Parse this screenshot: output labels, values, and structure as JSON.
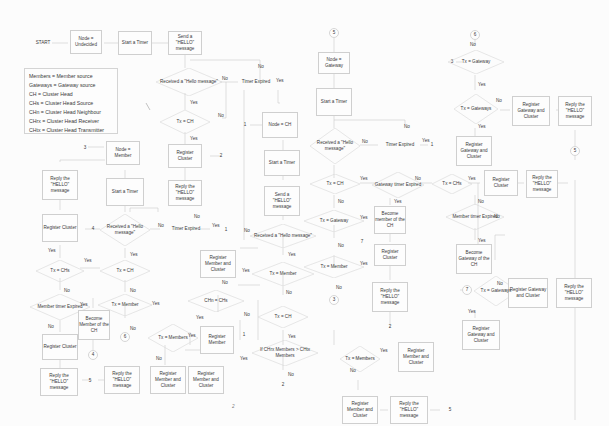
{
  "legend": [
    "Members = Member source",
    "Gateways = Gateway source",
    "CH = Cluster Head",
    "CHs = Cluster Head Source",
    "CHn = Cluster Head Neighbour",
    "CHrx = Cluster Head Receiver",
    "CHtx = Cluster Head Transmitter"
  ],
  "nodes": {
    "start": "START",
    "node_undecided": "Node = Undecided",
    "start_timer_1": "Start a Timer",
    "send_hello_1": "Send a \"HELLO\" message",
    "received_hello_1": "Received a \"Hello message\"",
    "timer_expired_1": "Timer Expired",
    "tx_ch_1": "Tx = CH",
    "register_cluster_1": "Register Cluster",
    "reply_hello_1": "Reply the \"HELLO\" message",
    "connector_2a": "2",
    "connector_1a": "1",
    "node_ch": "Node = CH",
    "start_timer_ch": "Start a Timer",
    "send_hello_ch": "Send a \"HELLO\" message",
    "received_hello_ch": "Received a \"Hello message\"",
    "tx_member_ch": "Tx = Member",
    "tx_ch_ch": "Tx = CH",
    "chrx_members": "If CHrx Members > CHtx Members",
    "connector_2b": "2",
    "register_member_cluster_a": "Register Member and Cluster",
    "chn_chs": "CHn = CHs",
    "register_member": "Register Member",
    "tx_members_ch": "Tx = Members",
    "register_member_cluster_b": "Register Member and Cluster",
    "register_member_cluster_c": "Register Member and Cluster",
    "reply_hello_ch": "Reply the \"HELLO\" message",
    "connector_1b": "1",
    "connector_3a": "3",
    "node_member": "Node = Member",
    "start_timer_m": "Start a Timer",
    "received_hello_m": "Received a \"Hello message\"",
    "timer_expired_m": "Timer Expired",
    "connector_1c": "1",
    "connector_4a": "4",
    "register_cluster_m": "Register Cluster",
    "reply_hello_m": "Reply the \"HELLO\" message",
    "tx_ch_m": "Tx = CH",
    "tx_chs_m": "Tx = CHs",
    "member_timer_expired": "Member timer Expired",
    "register_cluster_m2": "Register Cluster",
    "reply_hello_m2": "Reply the \"HELLO\" message",
    "connector_5a": "5",
    "tx_member_m": "Tx = Member",
    "become_member_ch": "Become Member of the CH",
    "connector_4b": "4",
    "connector_6a": "6",
    "connector_5b": "5",
    "node_gateway": "Node = Gateway",
    "start_timer_g": "Start a Timer",
    "received_hello_g": "Received a \"Hello message\"",
    "timer_expired_g": "Timer Expired",
    "connector_1d": "1",
    "tx_ch_g": "Tx = CH",
    "gateway_timer_expired": "Gateway timer Expired",
    "tx_chs_g": "Tx = CHs",
    "become_member_g": "Become member of the CH",
    "register_cluster_g": "Register Cluster",
    "reply_hello_g": "Reply the \"HELLO\" message",
    "connector_2c": "2",
    "member_timer_expired_g": "Member timer Expired",
    "become_gateway": "Become Gateway of the CH",
    "register_cluster_g2": "Register Cluster",
    "reply_hello_g2": "Reply the \"HELLO\" message",
    "tx_gateway_g": "Tx = Gateway",
    "connector_7a": "7",
    "tx_member_g": "Tx = Member",
    "connector_3b": "3",
    "tx_members_g": "Tx = Members",
    "register_member_cluster_g": "Register Member and Cluster",
    "register_member_cluster_g2": "Register Member and Cluster",
    "reply_hello_g3": "Reply the \"HELLO\" message",
    "connector_5c": "5",
    "connector_6b": "6",
    "connector_3c": "3",
    "tx_gateway_6": "Tx = Gateway",
    "tx_gateways_6": "Tx = Gateways",
    "register_gateway_cluster_a": "Register Gateway and Cluster",
    "reply_hello_6": "Reply the \"HELLO\" message",
    "register_gateway_cluster_b": "Register Gateway and Cluster",
    "connector_5d": "5",
    "connector_7b": "7",
    "tx_gateways_7": "Tx = Gateways",
    "register_gateway_cluster_c": "Register Gateway and Cluster",
    "reply_hello_7": "Reply the \"HELLO\" message",
    "register_gateway_cluster_d": "Register Gateway and Cluster"
  },
  "edge_labels": {
    "yes": "Yes",
    "no": "No"
  },
  "footer_mark": "2"
}
